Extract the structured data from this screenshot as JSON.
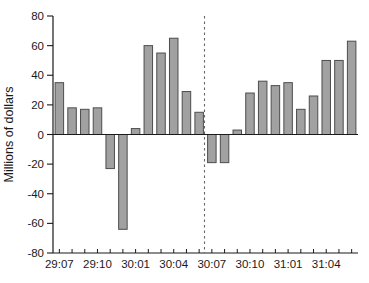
{
  "chart_data": {
    "type": "bar",
    "title": "",
    "xlabel": "",
    "ylabel": "Millions of dollars",
    "ylim": [
      -80,
      80
    ],
    "yticks": [
      80,
      60,
      40,
      20,
      0,
      -20,
      -40,
      -60,
      -80
    ],
    "x_tick_labels": [
      "29:07",
      "29:10",
      "30:01",
      "30:04",
      "30:07",
      "30:10",
      "31:01",
      "31:04"
    ],
    "x_label_every": 3,
    "values": [
      35,
      18,
      17,
      18,
      -23,
      -64,
      4,
      60,
      55,
      65,
      29,
      15,
      -19,
      -19,
      3,
      28,
      36,
      33,
      35,
      17,
      26,
      50,
      50,
      63
    ],
    "dashed_divider_before_index": 12,
    "grid": "off",
    "legend": "none",
    "colors": {
      "bar_fill": "#a1a1a1",
      "bar_stroke": "#4d4d4d",
      "axis": "#1a1a1a",
      "text": "#1a1a1a",
      "divider": "#666666",
      "background": "#ffffff"
    }
  }
}
